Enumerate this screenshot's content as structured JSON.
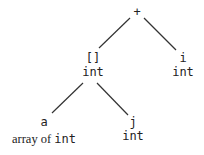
{
  "diagram": {
    "type": "expression-tree",
    "nodes": {
      "root": {
        "label": "+",
        "type": ""
      },
      "index": {
        "label": "[]",
        "type": "int"
      },
      "right_i": {
        "label": "i",
        "type": "int"
      },
      "array_a": {
        "label": "a",
        "type_prefix": "array of ",
        "type": "int"
      },
      "index_j": {
        "label": "j",
        "type": "int"
      }
    },
    "edges": [
      {
        "from": "root",
        "to": "index"
      },
      {
        "from": "root",
        "to": "right_i"
      },
      {
        "from": "index",
        "to": "array_a"
      },
      {
        "from": "index",
        "to": "index_j"
      }
    ],
    "line_color": "#333333"
  }
}
